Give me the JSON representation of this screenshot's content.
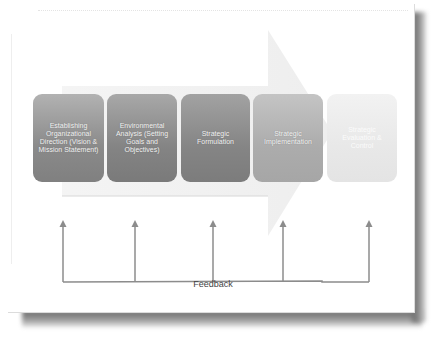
{
  "diagram": {
    "type": "process-flow",
    "title": "",
    "stages": [
      {
        "label": "Establishing Organizational Direction (Vision & Mission Statement)",
        "fill": "#8f8f8f"
      },
      {
        "label": "Environmental Analysis (Setting Goals and Objectives)",
        "fill": "#888888"
      },
      {
        "label": "Strategic Formulation",
        "fill": "#888888"
      },
      {
        "label": "Strategic Implementation",
        "fill": "#aeaeae"
      },
      {
        "label": "Strategic Evaluation & Control",
        "fill": "#e8e8e8"
      }
    ],
    "feedback": {
      "label": "Feedback",
      "arrow_count": 5,
      "line_color": "#8c8c8c"
    },
    "background_arrow_color": "#efefef",
    "page_color": "#ffffff",
    "shadow_color": "#7a7a7a"
  }
}
